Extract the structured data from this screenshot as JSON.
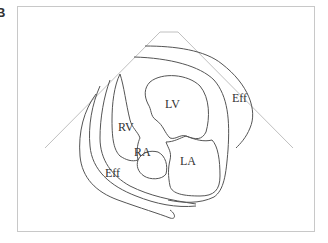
{
  "figure": {
    "panel_label": "B",
    "type": "echocardiographic schematic (apical four-chamber view with pericardial effusion)"
  },
  "labels": {
    "lv": "LV",
    "rv": "RV",
    "ra": "RA",
    "la": "LA",
    "eff_right": "Eff",
    "eff_left": "Eff"
  },
  "colors": {
    "outline": "#555555",
    "sector": "#c0c0c0",
    "frame": "#c8c8c8",
    "background": "#ffffff"
  }
}
